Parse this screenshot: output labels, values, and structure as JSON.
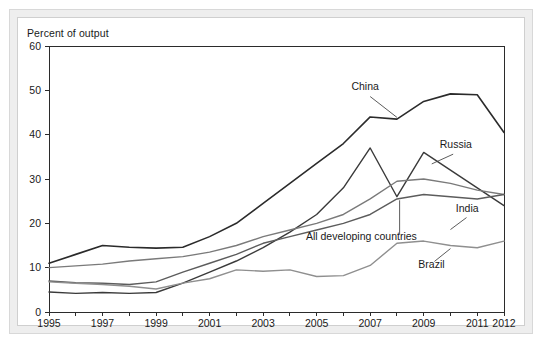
{
  "figure": {
    "axis_title": "Percent of output",
    "background_color": "#eeeeee",
    "plot_background_color": "#ffffff"
  },
  "chart_data": {
    "type": "line",
    "title": "",
    "subtitle": "",
    "xlabel": "",
    "ylabel": "Percent of output",
    "xlim": [
      1995,
      2012
    ],
    "ylim": [
      0,
      60
    ],
    "ytick_step": 10,
    "grid": false,
    "legend_position": "inline-labels",
    "x": [
      1995,
      1996,
      1997,
      1998,
      1999,
      2000,
      2001,
      2002,
      2003,
      2004,
      2005,
      2006,
      2007,
      2008,
      2009,
      2010,
      2011,
      2012
    ],
    "xticks": [
      1995,
      1997,
      1999,
      2001,
      2003,
      2005,
      2007,
      2009,
      2011,
      2012
    ],
    "xtick_labels": [
      "1995",
      "1997",
      "1999",
      "2001",
      "2003",
      "2005",
      "2007",
      "2009",
      "2011",
      "2012"
    ],
    "yticks": [
      0,
      10,
      20,
      30,
      40,
      50,
      60
    ],
    "ytick_labels": [
      "0",
      "10",
      "20",
      "30",
      "40",
      "50",
      "60"
    ],
    "series": [
      {
        "name": "China",
        "color": "#2b2b2b",
        "width": 1.6,
        "label": "China",
        "values": [
          11.0,
          13.0,
          15.0,
          14.6,
          14.4,
          14.6,
          17.0,
          20.0,
          24.5,
          29.0,
          33.5,
          38.0,
          44.0,
          43.5,
          47.5,
          49.2,
          49.0,
          40.5
        ]
      },
      {
        "name": "Russia",
        "color": "#3a3a3a",
        "width": 1.4,
        "label": "Russia",
        "values": [
          4.5,
          4.2,
          4.4,
          4.2,
          4.4,
          6.5,
          9.0,
          11.5,
          14.5,
          18.0,
          22.0,
          28.0,
          37.0,
          26.0,
          36.0,
          32.0,
          28.0,
          24.0
        ]
      },
      {
        "name": "India",
        "color": "#7a7a7a",
        "width": 1.4,
        "label": "India",
        "values": [
          10.0,
          10.4,
          10.8,
          11.5,
          12.0,
          12.5,
          13.5,
          15.0,
          17.0,
          18.5,
          20.0,
          22.0,
          25.5,
          29.5,
          30.0,
          29.0,
          27.5,
          26.5
        ]
      },
      {
        "name": "All developing countries",
        "color": "#5c5c5c",
        "width": 1.4,
        "label": "All developing countries",
        "values": [
          7.0,
          6.6,
          6.5,
          6.2,
          6.8,
          9.0,
          11.0,
          13.0,
          15.5,
          17.0,
          18.5,
          20.0,
          22.0,
          25.5,
          26.5,
          26.0,
          25.5,
          26.5
        ]
      },
      {
        "name": "Brazil",
        "color": "#8f8f8f",
        "width": 1.4,
        "label": "Brazil",
        "values": [
          6.8,
          6.5,
          6.2,
          5.8,
          5.2,
          6.5,
          7.5,
          9.5,
          9.2,
          9.5,
          8.0,
          8.2,
          10.5,
          15.5,
          16.0,
          15.0,
          14.5,
          16.0
        ]
      }
    ],
    "annotations": [
      {
        "text": "China",
        "x": 2006.3,
        "y": 50.0
      },
      {
        "text": "Russia",
        "x": 2009.6,
        "y": 37.0
      },
      {
        "text": "India",
        "x": 2010.2,
        "y": 22.5
      },
      {
        "text": "All developing countries",
        "x": 2004.6,
        "y": 16.2
      },
      {
        "text": "Brazil",
        "x": 2008.8,
        "y": 10.0
      }
    ]
  }
}
